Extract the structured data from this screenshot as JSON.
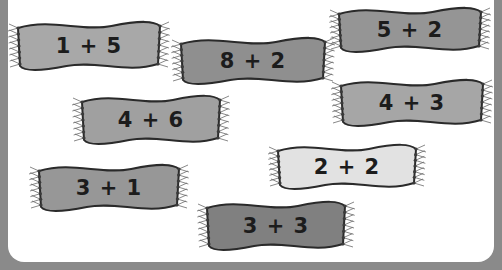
{
  "banners": [
    {
      "label": "1 + 5",
      "x": 14,
      "y": 22,
      "w": 150,
      "h": 48,
      "fill": "#a8a8a8"
    },
    {
      "label": "8 + 2",
      "x": 177,
      "y": 38,
      "w": 152,
      "h": 46,
      "fill": "#8f8f8f"
    },
    {
      "label": "5 + 2",
      "x": 335,
      "y": 8,
      "w": 150,
      "h": 44,
      "fill": "#959595"
    },
    {
      "label": "4 + 6",
      "x": 78,
      "y": 96,
      "w": 146,
      "h": 48,
      "fill": "#a0a0a0"
    },
    {
      "label": "4 + 3",
      "x": 337,
      "y": 80,
      "w": 150,
      "h": 46,
      "fill": "#a6a6a6"
    },
    {
      "label": "2 + 2",
      "x": 274,
      "y": 145,
      "w": 146,
      "h": 44,
      "fill": "#e2e2e2"
    },
    {
      "label": "3 + 1",
      "x": 35,
      "y": 165,
      "w": 148,
      "h": 46,
      "fill": "#979797"
    },
    {
      "label": "3 + 3",
      "x": 203,
      "y": 202,
      "w": 146,
      "h": 48,
      "fill": "#808080"
    }
  ],
  "colors": {
    "frame": "#8a8a8a",
    "panel": "#ffffff",
    "outline": "#2a2a2a",
    "text": "#1c1c1c"
  }
}
